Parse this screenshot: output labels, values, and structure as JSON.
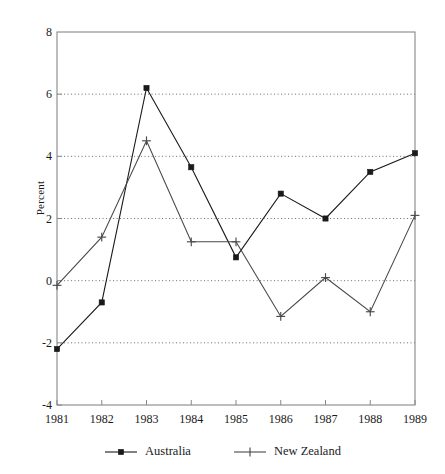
{
  "chart_data": {
    "type": "line",
    "title": "",
    "xlabel": "",
    "ylabel": "Percent",
    "categories": [
      "1981",
      "1982",
      "1983",
      "1984",
      "1985",
      "1986",
      "1987",
      "1988",
      "1989"
    ],
    "x": [
      1981,
      1982,
      1983,
      1984,
      1985,
      1986,
      1987,
      1988,
      1989
    ],
    "xlim": [
      1981,
      1989
    ],
    "ylim": [
      -4,
      8
    ],
    "yticks": [
      -4,
      -2,
      0,
      2,
      4,
      6,
      8
    ],
    "ytick_labels": [
      "-4",
      "-2",
      "0",
      "2",
      "4",
      "6",
      "8"
    ],
    "grid": true,
    "grid_style": "dotted",
    "grid_axis": "y",
    "legend_position": "bottom",
    "series": [
      {
        "name": "Australia",
        "marker": "square",
        "color": "#1a1a1a",
        "values": [
          -2.2,
          -0.7,
          6.2,
          3.65,
          0.75,
          2.8,
          2.0,
          3.5,
          4.1
        ]
      },
      {
        "name": "New Zealand",
        "marker": "plus",
        "color": "#4a4a4a",
        "values": [
          -0.15,
          1.4,
          4.5,
          1.25,
          1.25,
          -1.15,
          0.1,
          -1.0,
          2.1
        ]
      }
    ]
  },
  "legend": {
    "items": [
      {
        "label": "Australia",
        "marker": "square"
      },
      {
        "label": "New Zealand",
        "marker": "plus"
      }
    ]
  },
  "axes": {
    "y_axis_label": "Percent"
  },
  "colors": {
    "axis": "#888888",
    "grid": "#555555",
    "series_australia": "#1a1a1a",
    "series_new_zealand": "#4a4a4a",
    "background": "#ffffff"
  }
}
